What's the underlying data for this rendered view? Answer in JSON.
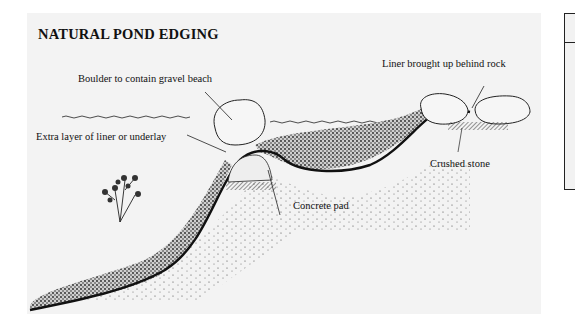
{
  "diagram": {
    "title": "NATURAL POND EDGING",
    "labels": {
      "boulder": "Boulder to contain gravel beach",
      "extra_liner": "Extra layer of liner or underlay",
      "concrete_pad": "Concrete pad",
      "liner_behind_rock": "Liner brought up behind rock",
      "crushed_stone": "Crushed stone"
    },
    "elements": [
      "water-line",
      "boulder",
      "gravel-beach",
      "pond-liner",
      "concrete-pad",
      "crushed-stone",
      "rocks",
      "plant",
      "soil"
    ]
  }
}
